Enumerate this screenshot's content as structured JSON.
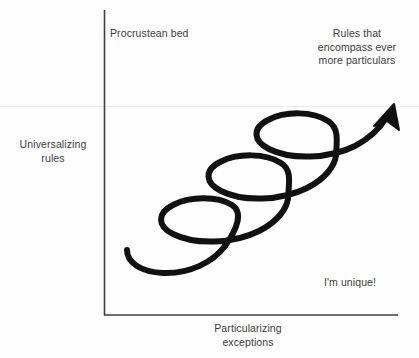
{
  "figure": {
    "type": "conceptual-diagram",
    "colors": {
      "ink": "#111111",
      "text": "#3c3c3c",
      "axis": "#3f3f3f",
      "background": "#fefefe",
      "scanline": "#f0eeec"
    },
    "axes": {
      "y_axis": {
        "label": "Universalizing\nrules"
      },
      "x_axis": {
        "label": "Particularizing\nexceptions"
      }
    },
    "annotations": [
      {
        "id": "procrustean-bed",
        "text": "Procrustean bed",
        "position": "top-left-inside"
      },
      {
        "id": "rules-encompass",
        "text": "Rules that\nencompass ever\nmore particulars",
        "position": "top-right-inside"
      },
      {
        "id": "im-unique",
        "text": "I'm unique!",
        "position": "bottom-right-inside"
      }
    ],
    "spiral": {
      "loops": 3,
      "direction": "ascending-left-to-right",
      "arrowhead": "top-right",
      "stroke_width": 6
    }
  }
}
